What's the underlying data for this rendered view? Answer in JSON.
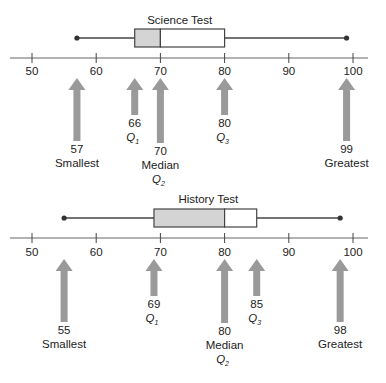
{
  "chart_data": [
    {
      "type": "boxplot",
      "title": "Science Test",
      "axis": {
        "min": 50,
        "max": 100,
        "ticks": [
          50,
          60,
          70,
          80,
          90,
          100
        ],
        "tick_labels": [
          "50",
          "60",
          "70",
          "80",
          "90",
          "100"
        ]
      },
      "five_number_summary": {
        "smallest": 57,
        "q1": 66,
        "median": 70,
        "q3": 80,
        "greatest": 99
      },
      "annotations": [
        {
          "value": 57,
          "label": "57",
          "name": "Smallest",
          "sub": ""
        },
        {
          "value": 66,
          "label": "66",
          "name": "Q",
          "sub": "1"
        },
        {
          "value": 70,
          "label": "70",
          "name": "Median",
          "q": "Q",
          "sub": "2"
        },
        {
          "value": 80,
          "label": "80",
          "name": "Q",
          "sub": "3"
        },
        {
          "value": 99,
          "label": "99",
          "name": "Greatest",
          "sub": ""
        }
      ]
    },
    {
      "type": "boxplot",
      "title": "History Test",
      "axis": {
        "min": 50,
        "max": 100,
        "ticks": [
          50,
          60,
          70,
          80,
          90,
          100
        ],
        "tick_labels": [
          "50",
          "60",
          "70",
          "80",
          "90",
          "100"
        ]
      },
      "five_number_summary": {
        "smallest": 55,
        "q1": 69,
        "median": 80,
        "q3": 85,
        "greatest": 98
      },
      "annotations": [
        {
          "value": 55,
          "label": "55",
          "name": "Smallest",
          "sub": ""
        },
        {
          "value": 69,
          "label": "69",
          "name": "Q",
          "sub": "1"
        },
        {
          "value": 80,
          "label": "80",
          "name": "Median",
          "q": "Q",
          "sub": "2"
        },
        {
          "value": 85,
          "label": "85",
          "name": "Q",
          "sub": "3"
        },
        {
          "value": 98,
          "label": "98",
          "name": "Greatest",
          "sub": ""
        }
      ]
    }
  ],
  "colors": {
    "box_fill": "#d4d4d4",
    "arrow": "#9a9a9a",
    "line": "#444444"
  }
}
